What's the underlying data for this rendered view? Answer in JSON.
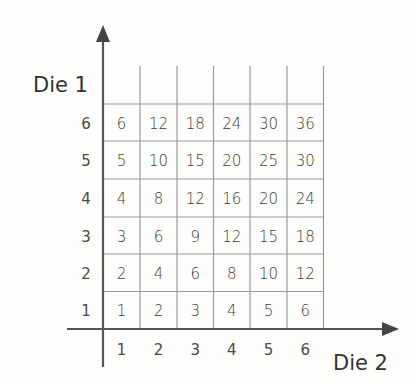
{
  "diagram": {
    "y_axis": {
      "label": "Die 1",
      "ticks": [
        "1",
        "2",
        "3",
        "4",
        "5",
        "6"
      ]
    },
    "x_axis": {
      "label": "Die 2",
      "ticks": [
        "1",
        "2",
        "3",
        "4",
        "5",
        "6"
      ]
    },
    "rows": [
      {
        "die1": "6",
        "values": [
          "6",
          "12",
          "18",
          "24",
          "30",
          "36"
        ]
      },
      {
        "die1": "5",
        "values": [
          "5",
          "10",
          "15",
          "20",
          "25",
          "30"
        ]
      },
      {
        "die1": "4",
        "values": [
          "4",
          "8",
          "12",
          "16",
          "20",
          "24"
        ]
      },
      {
        "die1": "3",
        "values": [
          "3",
          "6",
          "9",
          "12",
          "15",
          "18"
        ]
      },
      {
        "die1": "2",
        "values": [
          "2",
          "4",
          "6",
          "8",
          "10",
          "12"
        ]
      },
      {
        "die1": "1",
        "values": [
          "1",
          "2",
          "3",
          "4",
          "5",
          "6"
        ]
      }
    ],
    "colors": {
      "grid": "#9a9a9a",
      "axis": "#555555",
      "text": "#3c3c3c",
      "background": "#fdfdfb"
    }
  }
}
